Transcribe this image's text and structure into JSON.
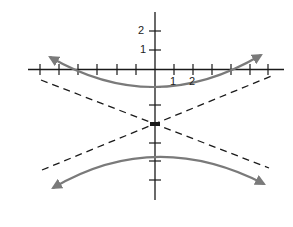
{
  "figure": {
    "center": [
      0,
      -3
    ],
    "vertices": [
      [
        0,
        -1
      ],
      [
        0,
        -5
      ]
    ],
    "equation": "(y+3)^2/4 - x^2/25 = 1",
    "axis_labels": {
      "y": [
        "2",
        "1"
      ],
      "x": [
        "1",
        "2"
      ]
    },
    "x_ticks": [
      -6,
      -5,
      -4,
      -3,
      -2,
      -1,
      1,
      2,
      3,
      4,
      5,
      6
    ],
    "y_ticks": [
      2,
      1,
      -1,
      -2,
      -3,
      -4,
      -5,
      -6
    ],
    "colors": {
      "axes": "#1a1a1a",
      "asymptotes": "#1a1a1a",
      "curve": "#7a7a7a"
    }
  }
}
